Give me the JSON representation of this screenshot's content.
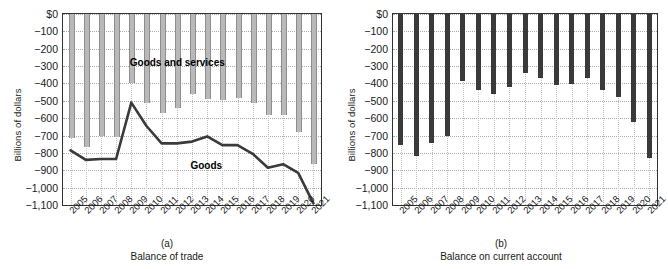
{
  "chart_data": [
    {
      "type": "line",
      "panel": "a",
      "letter": "(a)",
      "title": "Balance of trade",
      "xlabel": "",
      "ylabel": "Billions of dollars",
      "ylim": [
        -1100,
        0
      ],
      "ytick_labels": [
        "$0",
        "−100",
        "−200",
        "−300",
        "−400",
        "−500",
        "−600",
        "−700",
        "−800",
        "−900",
        "−1,000",
        "−1,100"
      ],
      "ytick_values": [
        0,
        -100,
        -200,
        -300,
        -400,
        -500,
        -600,
        -700,
        -800,
        -900,
        -1000,
        -1100
      ],
      "grid": true,
      "legend_position": "inline-annotation",
      "categories": [
        "2005",
        "2006",
        "2007",
        "2008",
        "2009",
        "2010",
        "2011",
        "2012",
        "2013",
        "2014",
        "2015",
        "2016",
        "2017",
        "2018",
        "2019",
        "2020",
        "2021"
      ],
      "series": [
        {
          "name": "Goods and services",
          "render": "bar",
          "color": "#b9b9b9",
          "values": [
            -715,
            -765,
            -705,
            -710,
            -400,
            -515,
            -570,
            -540,
            -460,
            -490,
            -495,
            -485,
            -515,
            -580,
            -580,
            -680,
            -865
          ]
        },
        {
          "name": "Goods",
          "render": "line",
          "color": "#3a3a3a",
          "values": [
            -785,
            -840,
            -835,
            -835,
            -510,
            -645,
            -745,
            -745,
            -735,
            -705,
            -755,
            -755,
            -805,
            -885,
            -865,
            -915,
            -1090
          ]
        }
      ]
    },
    {
      "type": "bar",
      "panel": "b",
      "letter": "(b)",
      "title": "Balance on current account",
      "xlabel": "",
      "ylabel": "Billions of dollars",
      "ylim": [
        -1100,
        0
      ],
      "ytick_labels": [
        "$0",
        "−100",
        "−200",
        "−300",
        "−400",
        "−500",
        "−600",
        "−700",
        "−800",
        "−900",
        "−1,000",
        "−1,100"
      ],
      "ytick_values": [
        0,
        -100,
        -200,
        -300,
        -400,
        -500,
        -600,
        -700,
        -800,
        -900,
        -1000,
        -1100
      ],
      "grid": true,
      "categories": [
        "2005",
        "2006",
        "2007",
        "2008",
        "2009",
        "2010",
        "2011",
        "2012",
        "2013",
        "2014",
        "2015",
        "2016",
        "2017",
        "2018",
        "2019",
        "2020",
        "2021"
      ],
      "values": [
        -755,
        -820,
        -745,
        -700,
        -385,
        -435,
        -460,
        -420,
        -340,
        -370,
        -410,
        -405,
        -370,
        -440,
        -480,
        -620,
        -830
      ],
      "bar_color": "#3a3a3a"
    }
  ],
  "annotations": {
    "goods_and_services": "Goods and services",
    "goods": "Goods"
  }
}
